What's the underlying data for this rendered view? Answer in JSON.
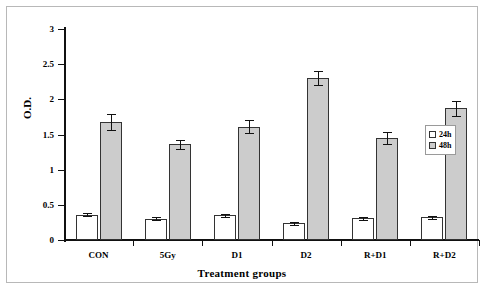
{
  "chart_data": {
    "type": "bar",
    "title": "",
    "xlabel": "Treatment groups",
    "ylabel": "O.D.",
    "ylim": [
      0,
      3
    ],
    "yticks": [
      0,
      0.5,
      1,
      1.5,
      2,
      2.5,
      3
    ],
    "ytick_labels": [
      "0",
      "0.5",
      "1",
      "1.5",
      "2",
      "2.5",
      "3"
    ],
    "grid": false,
    "legend_position": "right-inside",
    "categories": [
      "CON",
      "5Gy",
      "D1",
      "D2",
      "R+D1",
      "R+D2"
    ],
    "series": [
      {
        "name": "24h",
        "color": "#ffffff",
        "values": [
          0.36,
          0.3,
          0.35,
          0.24,
          0.31,
          0.32
        ],
        "errors": [
          0.02,
          0.02,
          0.02,
          0.02,
          0.02,
          0.02
        ]
      },
      {
        "name": "48h",
        "color": "#cccccc",
        "values": [
          1.68,
          1.36,
          1.61,
          2.3,
          1.45,
          1.87
        ],
        "errors": [
          0.11,
          0.06,
          0.09,
          0.1,
          0.09,
          0.11
        ]
      }
    ]
  },
  "legend": {
    "items": [
      {
        "label": "24h",
        "swatch": "white-square"
      },
      {
        "label": "48h",
        "swatch": "gray-square"
      }
    ]
  },
  "axes": {
    "y_title": "O.D.",
    "x_title": "Treatment groups"
  }
}
